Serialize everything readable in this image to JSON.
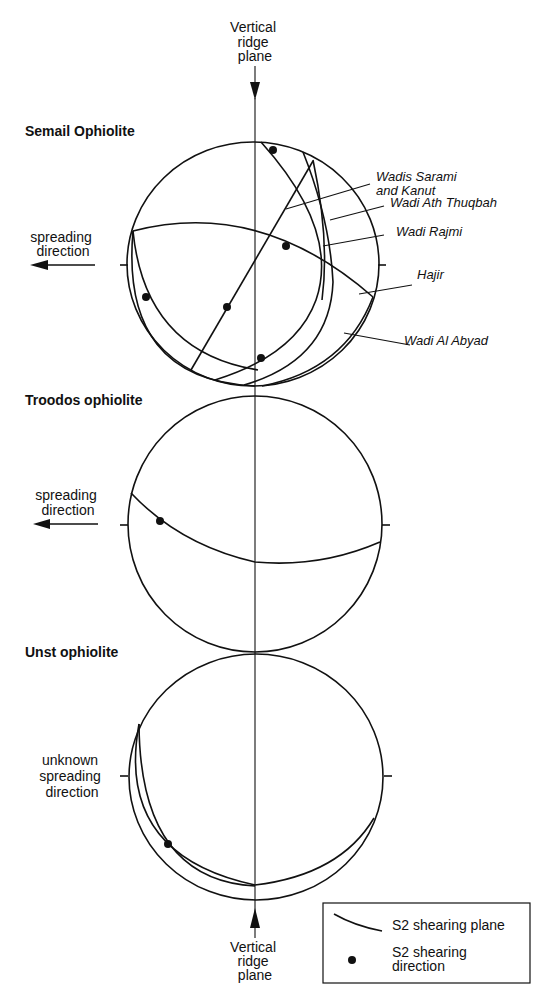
{
  "top_label": {
    "lines": [
      "Vertical",
      "ridge",
      "plane"
    ]
  },
  "bottom_label": {
    "lines": [
      "Vertical",
      "ridge",
      "plane"
    ]
  },
  "panels": [
    {
      "title": "Semail Ophiolite",
      "direction_label": [
        "spreading",
        "direction"
      ],
      "curve_labels": [
        {
          "lines": [
            "Wadis Sarami",
            "and Kanut"
          ]
        },
        {
          "lines": [
            "Wadi Ath Thuqbah"
          ]
        },
        {
          "lines": [
            "Wadi Rajmi"
          ]
        },
        {
          "lines": [
            "Hajir"
          ]
        },
        {
          "lines": [
            "Wadi Al Abyad"
          ]
        }
      ]
    },
    {
      "title": "Troodos ophiolite",
      "direction_label": [
        "spreading",
        "direction"
      ]
    },
    {
      "title": "Unst ophiolite",
      "direction_label": [
        "unknown",
        "spreading",
        "direction"
      ]
    }
  ],
  "legend": {
    "plane_label": "S2 shearing plane",
    "direction_label": [
      "S2 shearing",
      "direction"
    ]
  },
  "colors": {
    "ink": "#111111",
    "paper": "#ffffff"
  }
}
